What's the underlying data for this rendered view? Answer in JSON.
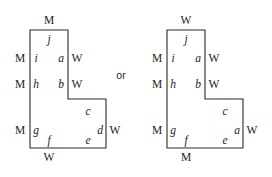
{
  "diagram": {
    "conjunction": {
      "text": "or",
      "x": 121,
      "y": 75
    },
    "stroke_color": "#2b2b2b",
    "background_color": "#ffffff",
    "figures": [
      {
        "id": "left-figure",
        "name": "left-l-polygon",
        "outline_points": "30,30 106,30 106,99 68,99 68,148 30,148",
        "outline_path": "M 68 30 L 106 30 L 106 99 L 30 99 L 30 148 L 68 148 Z",
        "path_d": "M 30 30 L 68 30 L 68 99 L 106 99 L 106 148 L 30 148 Z",
        "outer_labels": [
          {
            "name": "top-edge-label",
            "text": "M",
            "x": 49,
            "y": 21
          },
          {
            "name": "upper-left-edge-label",
            "text": "M",
            "x": 20,
            "y": 59
          },
          {
            "name": "middle-left-edge-label",
            "text": "M",
            "x": 20,
            "y": 85
          },
          {
            "name": "lower-left-edge-label",
            "text": "M",
            "x": 20,
            "y": 131
          },
          {
            "name": "upper-right-edge-label",
            "text": "W",
            "x": 77,
            "y": 59
          },
          {
            "name": "middle-right-edge-label",
            "text": "W",
            "x": 77,
            "y": 85
          },
          {
            "name": "lower-right-edge-label",
            "text": "W",
            "x": 115,
            "y": 131
          },
          {
            "name": "bottom-edge-label",
            "text": "W",
            "x": 49,
            "y": 158
          }
        ],
        "inner_labels": [
          {
            "name": "vertex-label-j",
            "text": "j",
            "x": 49,
            "y": 40
          },
          {
            "name": "vertex-label-i",
            "text": "i",
            "x": 36,
            "y": 59
          },
          {
            "name": "vertex-label-a",
            "text": "a",
            "x": 61,
            "y": 59
          },
          {
            "name": "vertex-label-h",
            "text": "h",
            "x": 36,
            "y": 85
          },
          {
            "name": "vertex-label-b",
            "text": "b",
            "x": 61,
            "y": 85
          },
          {
            "name": "vertex-label-c",
            "text": "c",
            "x": 88,
            "y": 112
          },
          {
            "name": "vertex-label-g",
            "text": "g",
            "x": 36,
            "y": 131
          },
          {
            "name": "vertex-label-d",
            "text": "d",
            "x": 100,
            "y": 131
          },
          {
            "name": "vertex-label-e",
            "text": "e",
            "x": 88,
            "y": 141
          },
          {
            "name": "vertex-label-f",
            "text": "f",
            "x": 49,
            "y": 141
          }
        ]
      },
      {
        "id": "right-figure",
        "name": "right-l-polygon",
        "outline_points": "167,30 243,30 243,99 205,99 205,148 167,148",
        "path_d": "M 167 30 L 205 30 L 205 99 L 243 99 L 243 148 L 167 148 Z",
        "outer_labels": [
          {
            "name": "top-edge-label",
            "text": "W",
            "x": 186,
            "y": 21
          },
          {
            "name": "upper-left-edge-label",
            "text": "M",
            "x": 157,
            "y": 59
          },
          {
            "name": "middle-left-edge-label",
            "text": "M",
            "x": 157,
            "y": 85
          },
          {
            "name": "lower-left-edge-label",
            "text": "M",
            "x": 157,
            "y": 131
          },
          {
            "name": "upper-right-edge-label",
            "text": "W",
            "x": 214,
            "y": 59
          },
          {
            "name": "middle-right-edge-label",
            "text": "W",
            "x": 214,
            "y": 85
          },
          {
            "name": "lower-right-edge-label",
            "text": "W",
            "x": 252,
            "y": 131
          },
          {
            "name": "bottom-edge-label",
            "text": "M",
            "x": 186,
            "y": 158
          }
        ],
        "inner_labels": [
          {
            "name": "vertex-label-j",
            "text": "j",
            "x": 186,
            "y": 40
          },
          {
            "name": "vertex-label-i",
            "text": "i",
            "x": 173,
            "y": 59
          },
          {
            "name": "vertex-label-a-top",
            "text": "a",
            "x": 198,
            "y": 59
          },
          {
            "name": "vertex-label-h",
            "text": "h",
            "x": 173,
            "y": 85
          },
          {
            "name": "vertex-label-b",
            "text": "b",
            "x": 198,
            "y": 85
          },
          {
            "name": "vertex-label-c",
            "text": "c",
            "x": 225,
            "y": 112
          },
          {
            "name": "vertex-label-g",
            "text": "g",
            "x": 173,
            "y": 131
          },
          {
            "name": "vertex-label-a-right",
            "text": "a",
            "x": 237,
            "y": 131
          },
          {
            "name": "vertex-label-e",
            "text": "e",
            "x": 225,
            "y": 141
          },
          {
            "name": "vertex-label-f",
            "text": "f",
            "x": 186,
            "y": 141
          }
        ]
      }
    ]
  }
}
